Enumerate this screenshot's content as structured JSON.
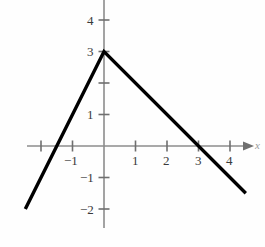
{
  "chart_data": {
    "type": "line",
    "title": "",
    "subtitle": "",
    "xlabel": "x",
    "ylabel": "",
    "xlim": [
      -2.7,
      4.9
    ],
    "ylim": [
      -2.4,
      4.6
    ],
    "grid": false,
    "legend": null,
    "x_ticks": [
      -2,
      -1,
      1,
      2,
      3,
      4
    ],
    "x_tick_labels": [
      "",
      "−1",
      "1",
      "2",
      "3",
      "4"
    ],
    "y_ticks": [
      -2,
      -1,
      1,
      2,
      3,
      4
    ],
    "y_tick_labels": [
      "−2",
      "−1",
      "1",
      "",
      "3",
      "4"
    ],
    "series": [
      {
        "name": "piecewise-absolute-value",
        "x": [
          -2.5,
          0,
          4.5
        ],
        "y": [
          -2.0,
          3.0,
          -1.5
        ],
        "color": "#000000",
        "linewidth": 3.4
      }
    ],
    "annotations": {
      "vertex": {
        "x": 0,
        "y": 3
      },
      "left_x_intercept": {
        "x": -1.5,
        "y": 0
      },
      "right_x_intercept": {
        "x": 3,
        "y": 0
      }
    },
    "axis_color": "#8c8c8c",
    "curve_color": "#0a0a0a"
  },
  "axis": {
    "x_label": "x",
    "origin_px": {
      "x": 104,
      "y": 146
    },
    "unit_px": 31.5
  },
  "x_tick_labels": [
    {
      "text": "−1",
      "value": -1
    },
    {
      "text": "1",
      "value": 1
    },
    {
      "text": "2",
      "value": 2
    },
    {
      "text": "3",
      "value": 3
    },
    {
      "text": "4",
      "value": 4
    }
  ],
  "y_tick_labels": [
    {
      "text": "4",
      "value": 4
    },
    {
      "text": "3",
      "value": 3
    },
    {
      "text": "1",
      "value": 1
    },
    {
      "text": "−1",
      "value": -1
    },
    {
      "text": "−2",
      "value": -2
    }
  ]
}
